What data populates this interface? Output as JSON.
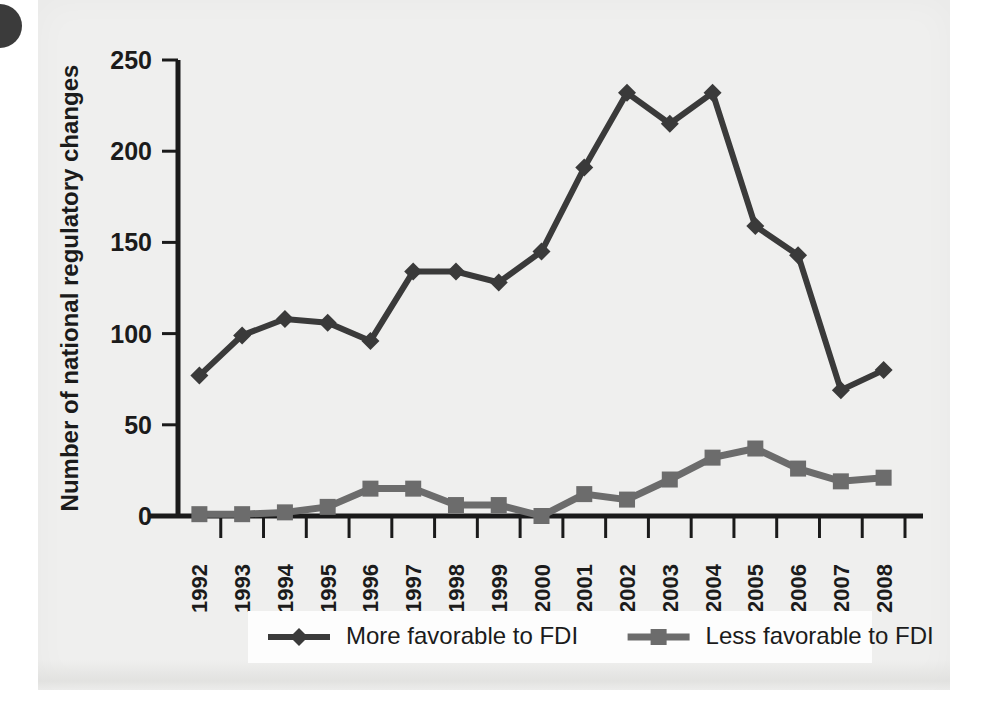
{
  "chart_data": {
    "type": "line",
    "title": "",
    "xlabel": "",
    "ylabel": "Number of national regulatory changes",
    "categories": [
      "1992",
      "1993",
      "1994",
      "1995",
      "1996",
      "1997",
      "1998",
      "1999",
      "2000",
      "2001",
      "2002",
      "2003",
      "2004",
      "2005",
      "2006",
      "2007",
      "2008"
    ],
    "ylim": [
      0,
      250
    ],
    "yticks": [
      0,
      50,
      100,
      150,
      200,
      250
    ],
    "ytick_labels": [
      "0",
      "50",
      "100",
      "150",
      "200",
      "250"
    ],
    "grid": false,
    "legend_position": "bottom",
    "series": [
      {
        "name": "More favorable to FDI",
        "marker": "diamond",
        "color": "#3a3a3a",
        "values": [
          77,
          99,
          108,
          106,
          96,
          134,
          134,
          128,
          145,
          191,
          232,
          215,
          232,
          159,
          143,
          69,
          80
        ]
      },
      {
        "name": "Less favorable to FDI",
        "marker": "square",
        "color": "#6c6c6c",
        "values": [
          1,
          1,
          2,
          5,
          15,
          15,
          6,
          6,
          0,
          12,
          9,
          20,
          32,
          37,
          26,
          19,
          21
        ]
      }
    ]
  },
  "figure": {
    "panel_background": "#efefee",
    "axis_color": "#1a1a1a",
    "bullet": "page-bullet-mark"
  }
}
